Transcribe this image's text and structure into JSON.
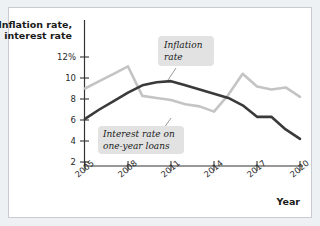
{
  "chart_data": {
    "type": "line",
    "title": "Inflation rate, interest rate",
    "xlabel": "Year",
    "ylabel": "Inflation rate, interest rate",
    "x": [
      2005,
      2006,
      2007,
      2008,
      2009,
      2010,
      2011,
      2012,
      2013,
      2014,
      2015,
      2016,
      2017,
      2018,
      2019,
      2020
    ],
    "xlim": [
      2005,
      2020
    ],
    "ylim": [
      0,
      13
    ],
    "ytick_labels": [
      "12%",
      "10",
      "8",
      "6",
      "4",
      "2"
    ],
    "ytick_values": [
      12,
      10,
      8,
      6,
      4,
      2
    ],
    "xtick_labels": [
      "2005",
      "2008",
      "2011",
      "2014",
      "2017",
      "2020"
    ],
    "xtick_values": [
      2005,
      2008,
      2011,
      2014,
      2017,
      2020
    ],
    "grid": false,
    "legend_position": "inline-callout",
    "series": [
      {
        "name": "Inflation rate",
        "color": "#c4c4c4",
        "values": [
          9.0,
          9.7,
          10.4,
          11.1,
          8.3,
          8.1,
          7.9,
          7.5,
          7.3,
          6.8,
          8.4,
          10.4,
          9.2,
          8.9,
          9.1,
          8.2
        ]
      },
      {
        "name": "Interest rate on one-year loans",
        "color": "#3a3a3a",
        "values": [
          6.1,
          7.0,
          7.8,
          8.6,
          9.3,
          9.6,
          9.7,
          9.3,
          8.9,
          8.5,
          8.1,
          7.4,
          6.3,
          6.3,
          5.1,
          4.2
        ]
      }
    ],
    "annotations": [
      {
        "id": "inflation-callout",
        "text_line1": "Inflation",
        "text_line2": "rate"
      },
      {
        "id": "interest-callout",
        "text_line1": "Interest rate on",
        "text_line2": "one-year loans"
      }
    ]
  },
  "labels": {
    "axis_title_line1": "Inflation rate,",
    "axis_title_line2": "interest rate",
    "x_axis_title": "Year"
  }
}
